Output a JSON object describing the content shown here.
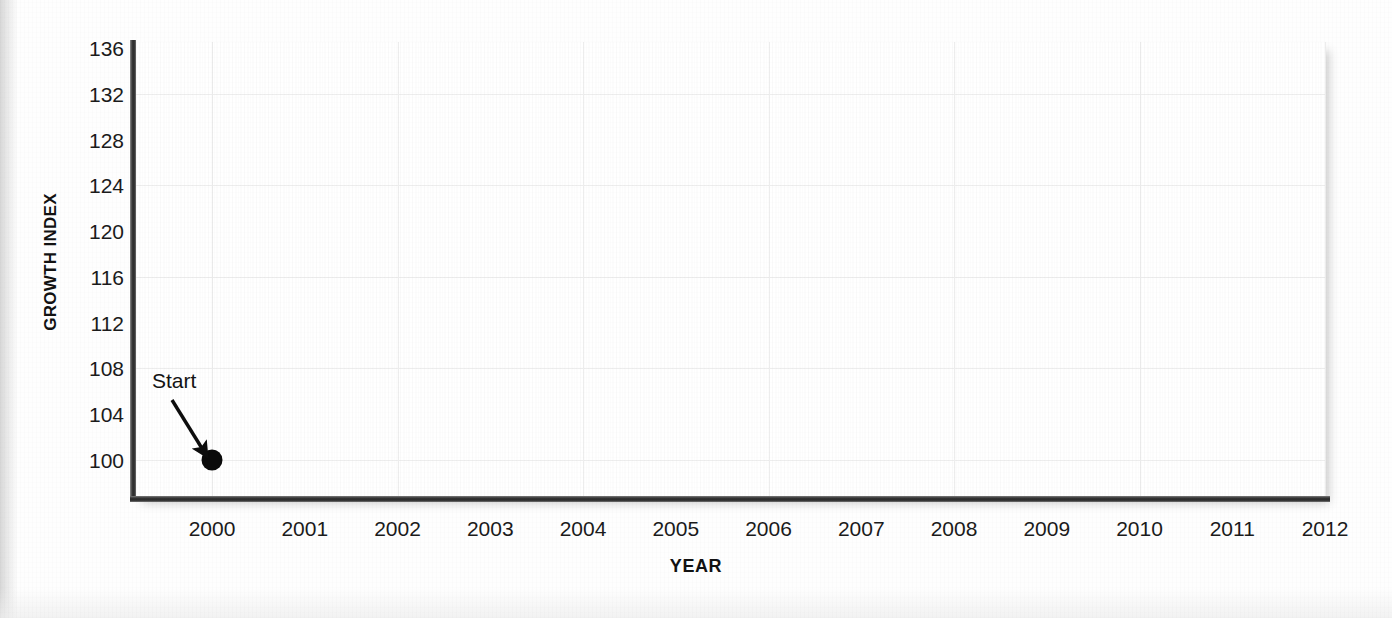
{
  "chart_data": {
    "type": "scatter",
    "title": "",
    "xlabel": "YEAR",
    "ylabel": "GROWTH INDEX",
    "x": [
      2000
    ],
    "values": [
      100
    ],
    "series": [
      {
        "name": "Growth index",
        "points": [
          {
            "x": 2000,
            "y": 100
          }
        ]
      }
    ],
    "xlim": [
      2000,
      2012
    ],
    "ylim": [
      98,
      136
    ],
    "x_ticks": [
      2000,
      2001,
      2002,
      2003,
      2004,
      2005,
      2006,
      2007,
      2008,
      2009,
      2010,
      2011,
      2012
    ],
    "y_ticks": [
      100,
      104,
      108,
      112,
      116,
      120,
      124,
      128,
      132,
      136
    ],
    "y_tick_labels": [
      "136",
      "132",
      "128",
      "124",
      "120",
      "116",
      "112",
      "108",
      "104",
      "100"
    ],
    "x_tick_labels": [
      "2000",
      "2001",
      "2002",
      "2003",
      "2004",
      "2005",
      "2006",
      "2007",
      "2008",
      "2009",
      "2010",
      "2011",
      "2012"
    ],
    "grid": true,
    "grid_y_step": 8,
    "grid_x_step": 2,
    "legend": "none",
    "annotations": [
      {
        "text": "Start",
        "points_to_x": 2000,
        "points_to_y": 100,
        "style": "arrow"
      }
    ],
    "colors": {
      "marker": "#0a0a0a",
      "axis": "#2b2b2b",
      "gridline": "#ededed",
      "panel_background": "#ffffff",
      "figure_background": "#fefefe",
      "text": "#1b1b1b"
    }
  },
  "axes": {
    "y_title": "GROWTH INDEX",
    "x_title": "YEAR"
  },
  "annotation": {
    "start_label": "Start"
  }
}
